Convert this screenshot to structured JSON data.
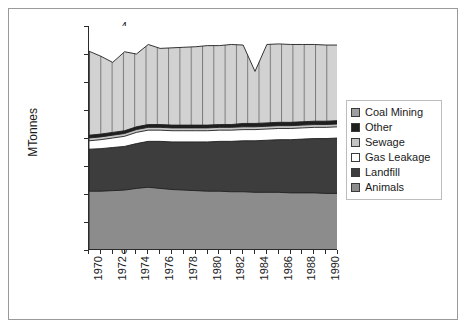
{
  "chart_data": {
    "type": "area",
    "title": "",
    "subtitle": "",
    "xlabel": "",
    "ylabel": "MTonnes",
    "ylim": [
      0,
      4
    ],
    "ytick_values": [
      0,
      0.5,
      1,
      1.5,
      2,
      2.5,
      3,
      3.5,
      4
    ],
    "ytick_labels": [
      "0",
      "0.5",
      "1",
      "1.5",
      "2",
      "2.5",
      "3",
      "3.5",
      "4"
    ],
    "grid": false,
    "stacked": true,
    "legend_position": "right",
    "x": [
      1970,
      1971,
      1972,
      1973,
      1974,
      1975,
      1976,
      1977,
      1978,
      1979,
      1980,
      1981,
      1982,
      1983,
      1984,
      1985,
      1986,
      1987,
      1988,
      1989,
      1990,
      1991
    ],
    "xtick_labels": [
      "1970",
      "",
      "1972",
      "",
      "1974",
      "",
      "1976",
      "",
      "1978",
      "",
      "1980",
      "",
      "1982",
      "",
      "1984",
      "",
      "1986",
      "",
      "1988",
      "",
      "1990",
      ""
    ],
    "xtick_labels_shown": [
      "1970",
      "1972",
      "1974",
      "1976",
      "1978",
      "1980",
      "1982",
      "1984",
      "1986",
      "1988",
      "1990"
    ],
    "series": [
      {
        "name": "Animals",
        "color": "#8c8c8c",
        "hatch": "none",
        "values": [
          1.05,
          1.05,
          1.06,
          1.07,
          1.1,
          1.12,
          1.1,
          1.08,
          1.07,
          1.06,
          1.05,
          1.05,
          1.04,
          1.04,
          1.03,
          1.03,
          1.03,
          1.02,
          1.02,
          1.02,
          1.01,
          1.01
        ]
      },
      {
        "name": "Landfill",
        "color": "#3d3d3d",
        "hatch": "none",
        "values": [
          0.75,
          0.76,
          0.77,
          0.78,
          0.8,
          0.82,
          0.84,
          0.85,
          0.86,
          0.87,
          0.88,
          0.89,
          0.9,
          0.91,
          0.92,
          0.93,
          0.94,
          0.95,
          0.96,
          0.97,
          0.98,
          0.99
        ]
      },
      {
        "name": "Gas Leakage",
        "color": "#ffffff",
        "hatch": "none",
        "values": [
          0.15,
          0.16,
          0.17,
          0.18,
          0.2,
          0.2,
          0.2,
          0.2,
          0.2,
          0.2,
          0.2,
          0.2,
          0.2,
          0.2,
          0.2,
          0.2,
          0.2,
          0.2,
          0.2,
          0.2,
          0.2,
          0.2
        ]
      },
      {
        "name": "Sewage",
        "color": "#c4c4c4",
        "hatch": "none",
        "values": [
          0.05,
          0.05,
          0.05,
          0.05,
          0.05,
          0.05,
          0.05,
          0.05,
          0.05,
          0.05,
          0.05,
          0.05,
          0.05,
          0.05,
          0.05,
          0.05,
          0.05,
          0.05,
          0.05,
          0.05,
          0.05,
          0.05
        ]
      },
      {
        "name": "Other",
        "color": "#1f1f1f",
        "hatch": "none",
        "values": [
          0.05,
          0.05,
          0.05,
          0.05,
          0.05,
          0.05,
          0.05,
          0.05,
          0.05,
          0.05,
          0.05,
          0.05,
          0.05,
          0.06,
          0.06,
          0.06,
          0.06,
          0.06,
          0.06,
          0.06,
          0.06,
          0.06
        ]
      },
      {
        "name": "Coal Mining",
        "color": "#9e9e9e",
        "hatch": "vertical-lines",
        "values": [
          1.5,
          1.39,
          1.25,
          1.41,
          1.3,
          1.43,
          1.36,
          1.38,
          1.39,
          1.4,
          1.42,
          1.41,
          1.43,
          1.4,
          0.93,
          1.4,
          1.4,
          1.39,
          1.38,
          1.37,
          1.36,
          1.35
        ]
      }
    ],
    "stack_order_bottom_to_top": [
      "Animals",
      "Landfill",
      "Gas Leakage",
      "Sewage",
      "Other",
      "Coal Mining"
    ],
    "cumulative_tops": {
      "Animals": [
        1.05,
        1.05,
        1.06,
        1.07,
        1.1,
        1.12,
        1.1,
        1.08,
        1.07,
        1.06,
        1.05,
        1.05,
        1.04,
        1.04,
        1.03,
        1.03,
        1.03,
        1.02,
        1.02,
        1.02,
        1.01,
        1.01
      ],
      "Landfill": [
        1.8,
        1.81,
        1.83,
        1.85,
        1.9,
        1.94,
        1.94,
        1.93,
        1.93,
        1.93,
        1.93,
        1.94,
        1.94,
        1.95,
        1.95,
        1.96,
        1.97,
        1.97,
        1.98,
        1.99,
        1.99,
        2.0
      ],
      "Gas Leakage": [
        1.95,
        1.97,
        2.0,
        2.03,
        2.1,
        2.14,
        2.14,
        2.13,
        2.13,
        2.13,
        2.13,
        2.14,
        2.14,
        2.15,
        2.15,
        2.16,
        2.17,
        2.17,
        2.18,
        2.19,
        2.19,
        2.2
      ],
      "Sewage": [
        2.0,
        2.02,
        2.05,
        2.08,
        2.15,
        2.19,
        2.19,
        2.18,
        2.18,
        2.18,
        2.18,
        2.19,
        2.19,
        2.2,
        2.2,
        2.21,
        2.22,
        2.22,
        2.23,
        2.24,
        2.24,
        2.25
      ],
      "Other": [
        2.05,
        2.07,
        2.1,
        2.13,
        2.2,
        2.24,
        2.24,
        2.23,
        2.23,
        2.23,
        2.23,
        2.24,
        2.24,
        2.26,
        2.26,
        2.27,
        2.28,
        2.28,
        2.29,
        2.3,
        2.3,
        2.31
      ],
      "Coal Mining": [
        3.55,
        3.46,
        3.35,
        3.54,
        3.5,
        3.67,
        3.6,
        3.61,
        3.62,
        3.63,
        3.65,
        3.65,
        3.67,
        3.66,
        3.19,
        3.67,
        3.68,
        3.67,
        3.67,
        3.67,
        3.66,
        3.66
      ]
    },
    "annotations": [
      {
        "text": "sharp dip in Coal Mining band",
        "year": 1984,
        "value": 2.97
      }
    ]
  },
  "legend": {
    "items": [
      {
        "label": "Coal Mining",
        "color": "#9e9e9e"
      },
      {
        "label": "Other",
        "color": "#1f1f1f"
      },
      {
        "label": "Sewage",
        "color": "#c4c4c4"
      },
      {
        "label": "Gas Leakage",
        "color": "#ffffff"
      },
      {
        "label": "Landfill",
        "color": "#3d3d3d"
      },
      {
        "label": "Animals",
        "color": "#8c8c8c"
      }
    ]
  }
}
